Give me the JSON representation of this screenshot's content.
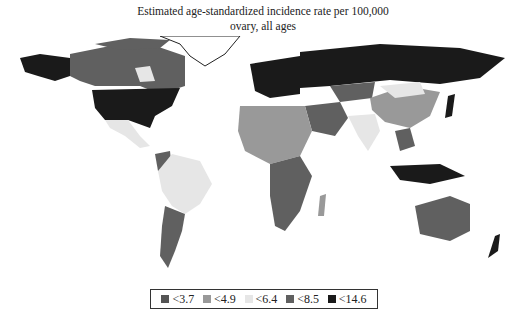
{
  "title": {
    "line1": "Estimated age-standardized incidence rate per 100,000",
    "line2": "ovary, all ages"
  },
  "legend": {
    "items": [
      {
        "label": "<3.7",
        "color": "#555555"
      },
      {
        "label": "<4.9",
        "color": "#999999"
      },
      {
        "label": "<6.4",
        "color": "#e6e6e6"
      },
      {
        "label": "<8.5",
        "color": "#606060"
      },
      {
        "label": "<14.6",
        "color": "#1a1a1a"
      }
    ]
  },
  "map": {
    "type": "world choropleth",
    "regions": [
      {
        "name": "United States",
        "class": "<14.6"
      },
      {
        "name": "Canada",
        "class": "<8.5"
      },
      {
        "name": "Alaska",
        "class": "<14.6"
      },
      {
        "name": "Mexico",
        "class": "<6.4"
      },
      {
        "name": "Brazil",
        "class": "<6.4"
      },
      {
        "name": "Argentina",
        "class": "<8.5"
      },
      {
        "name": "Russia",
        "class": "<14.6"
      },
      {
        "name": "Europe",
        "class": "<14.6"
      },
      {
        "name": "China",
        "class": "<4.9"
      },
      {
        "name": "India",
        "class": "<6.4"
      },
      {
        "name": "Australia",
        "class": "<8.5"
      },
      {
        "name": "North Africa",
        "class": "<4.9"
      },
      {
        "name": "Southern Africa",
        "class": "<8.5"
      }
    ]
  }
}
